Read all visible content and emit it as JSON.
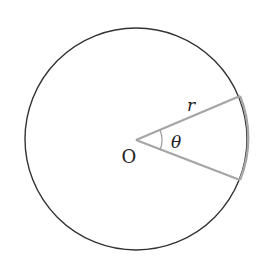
{
  "diagram": {
    "canvas": {
      "width": 268,
      "height": 264
    },
    "circle": {
      "cx": 136,
      "cy": 139,
      "r": 111,
      "stroke": "#333333"
    },
    "center_label": "O",
    "radius_label": "r",
    "angle_label": "θ",
    "sector": {
      "vertex": [
        136,
        140
      ],
      "upper_end": [
        240,
        96
      ],
      "lower_end": [
        240,
        180
      ],
      "stroke": "#a6a6a6"
    },
    "angle_arc_radius": 26
  }
}
